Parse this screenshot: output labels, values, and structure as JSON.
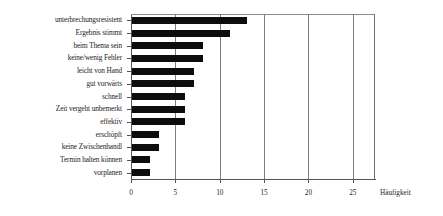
{
  "chart_data": {
    "type": "bar",
    "orientation": "horizontal",
    "title": "",
    "xlabel": "Häufigkeit",
    "ylabel": "",
    "xlim": [
      0,
      27.5
    ],
    "xticks": [
      0,
      5,
      10,
      15,
      20,
      25
    ],
    "xtick_labels": [
      "0",
      "5",
      "10",
      "15",
      "20",
      "25"
    ],
    "grid": true,
    "grid_axis": "x",
    "legend": false,
    "bar_color": "#0d0d0d",
    "categories": [
      "unterbrechungsresistent",
      "Ergebnis stimmt",
      "beim Thema sein",
      "keine/wenig Fehler",
      "leicht von Hand",
      "gut vorwärts",
      "schnell",
      "Zeit vergeht unbemerkt",
      "effektiv",
      "erschöpft",
      "keine Zwischenhandl",
      "Termin halten können",
      "vorplanen"
    ],
    "values": [
      13,
      11,
      8,
      8,
      7,
      7,
      6,
      6,
      6,
      3,
      3,
      2,
      2
    ]
  }
}
